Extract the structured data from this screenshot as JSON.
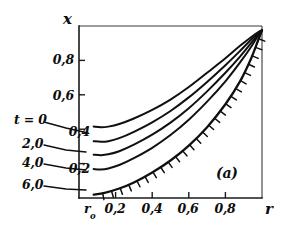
{
  "figure": {
    "panel_label": "(a)",
    "axes": {
      "x_axis_name": "r",
      "y_axis_name": "x",
      "x_origin_label": "r",
      "x_origin_sub": "o",
      "x_tick_labels": [
        "0,2",
        "0,4",
        "0,6",
        "0,8"
      ],
      "x_tick_values": [
        0.2,
        0.4,
        0.6,
        0.8
      ],
      "y_tick_labels": [
        "0,2",
        "0,4",
        "0,6",
        "0,8"
      ],
      "y_tick_values": [
        0.2,
        0.4,
        0.6,
        0.8
      ]
    },
    "curve_labels": [
      {
        "id": "t0",
        "text": "t = 0"
      },
      {
        "id": "t2",
        "text": "2,0"
      },
      {
        "id": "t4",
        "text": "4,0"
      },
      {
        "id": "t6",
        "text": "6,0"
      }
    ]
  },
  "chart_data": {
    "type": "line",
    "title": "",
    "subtitle": "",
    "xlabel": "r",
    "ylabel": "x",
    "xlim": [
      0,
      1
    ],
    "ylim": [
      0,
      1
    ],
    "grid": false,
    "legend_position": "inline-left-labels",
    "annotations": [
      {
        "text": "(a)",
        "x": 0.75,
        "y": 0.18
      },
      {
        "text": "r_o",
        "x": 0.08,
        "y": -0.08
      }
    ],
    "series": [
      {
        "name": "t = 0",
        "label": "t = 0",
        "points": [
          [
            0.08,
            0.415
          ],
          [
            0.12,
            0.412
          ],
          [
            0.16,
            0.415
          ],
          [
            0.22,
            0.43
          ],
          [
            0.3,
            0.462
          ],
          [
            0.4,
            0.512
          ],
          [
            0.5,
            0.572
          ],
          [
            0.6,
            0.645
          ],
          [
            0.7,
            0.728
          ],
          [
            0.8,
            0.812
          ],
          [
            0.88,
            0.885
          ],
          [
            0.94,
            0.935
          ],
          [
            0.98,
            0.965
          ],
          [
            1.0,
            0.975
          ]
        ]
      },
      {
        "name": "2,0",
        "label": "2,0",
        "points": [
          [
            0.08,
            0.33
          ],
          [
            0.12,
            0.327
          ],
          [
            0.16,
            0.33
          ],
          [
            0.22,
            0.348
          ],
          [
            0.3,
            0.385
          ],
          [
            0.4,
            0.44
          ],
          [
            0.5,
            0.506
          ],
          [
            0.6,
            0.585
          ],
          [
            0.7,
            0.675
          ],
          [
            0.8,
            0.772
          ],
          [
            0.88,
            0.855
          ],
          [
            0.94,
            0.92
          ],
          [
            0.98,
            0.958
          ],
          [
            1.0,
            0.975
          ]
        ]
      },
      {
        "name": "4,0",
        "label": "4,0",
        "points": [
          [
            0.08,
            0.252
          ],
          [
            0.12,
            0.249
          ],
          [
            0.16,
            0.254
          ],
          [
            0.22,
            0.272
          ],
          [
            0.3,
            0.31
          ],
          [
            0.4,
            0.368
          ],
          [
            0.5,
            0.438
          ],
          [
            0.6,
            0.522
          ],
          [
            0.7,
            0.62
          ],
          [
            0.8,
            0.728
          ],
          [
            0.88,
            0.822
          ],
          [
            0.94,
            0.9
          ],
          [
            0.98,
            0.952
          ],
          [
            1.0,
            0.975
          ]
        ]
      },
      {
        "name": "6,0",
        "label": "6,0",
        "points": [
          [
            0.08,
            0.168
          ],
          [
            0.12,
            0.166
          ],
          [
            0.16,
            0.172
          ],
          [
            0.22,
            0.192
          ],
          [
            0.3,
            0.232
          ],
          [
            0.4,
            0.292
          ],
          [
            0.5,
            0.366
          ],
          [
            0.6,
            0.455
          ],
          [
            0.7,
            0.56
          ],
          [
            0.8,
            0.678
          ],
          [
            0.88,
            0.788
          ],
          [
            0.94,
            0.878
          ],
          [
            0.98,
            0.945
          ],
          [
            1.0,
            0.975
          ]
        ]
      },
      {
        "name": "boundary",
        "label": "",
        "hatched": true,
        "points": [
          [
            0.08,
            0.02
          ],
          [
            0.14,
            0.03
          ],
          [
            0.22,
            0.055
          ],
          [
            0.3,
            0.09
          ],
          [
            0.4,
            0.148
          ],
          [
            0.5,
            0.218
          ],
          [
            0.6,
            0.305
          ],
          [
            0.7,
            0.412
          ],
          [
            0.8,
            0.545
          ],
          [
            0.88,
            0.678
          ],
          [
            0.94,
            0.81
          ],
          [
            0.98,
            0.92
          ],
          [
            1.0,
            0.975
          ]
        ]
      }
    ]
  }
}
